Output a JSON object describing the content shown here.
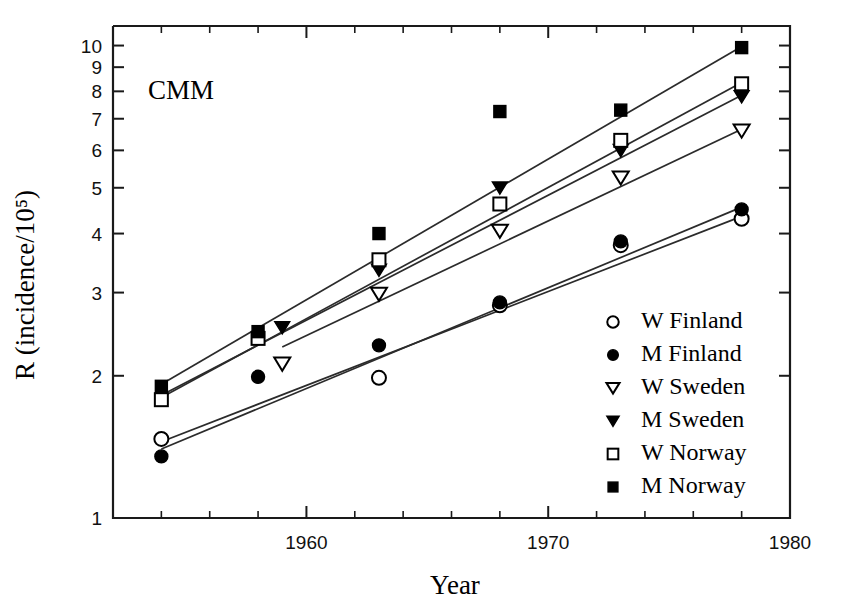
{
  "chart_data": {
    "type": "scatter",
    "title": "",
    "panel_label": "CMM",
    "xlabel": "Year",
    "ylabel": "R (incidence/10⁵)",
    "yscale": "log",
    "xscale": "linear",
    "xlim": [
      1952,
      1980
    ],
    "ylim": [
      1,
      11
    ],
    "grid": false,
    "legend_position": "center-right",
    "x_ticks_major": [
      1960,
      1970,
      1980
    ],
    "x_tick_labels": [
      "1960",
      "1970",
      "1980"
    ],
    "x_ticks_minor": [
      1954,
      1956,
      1958,
      1962,
      1964,
      1966,
      1968,
      1972,
      1974,
      1976,
      1978
    ],
    "y_ticks": [
      1,
      2,
      3,
      4,
      5,
      6,
      7,
      8,
      9,
      10
    ],
    "y_tick_labels": [
      "1",
      "2",
      "3",
      "4",
      "5",
      "6",
      "7",
      "8",
      "9",
      "10"
    ],
    "series": [
      {
        "name": "W Finland",
        "marker": "circle-open",
        "x": [
          1954,
          1963,
          1968,
          1973,
          1978
        ],
        "y": [
          1.47,
          1.98,
          2.82,
          3.78,
          4.3
        ],
        "fit_line": {
          "x": [
            1954,
            1978
          ],
          "y": [
            1.45,
            4.35
          ]
        }
      },
      {
        "name": "M Finland",
        "marker": "circle-filled",
        "x": [
          1954,
          1958,
          1963,
          1968,
          1973,
          1978
        ],
        "y": [
          1.35,
          1.99,
          2.32,
          2.86,
          3.85,
          4.5
        ],
        "fit_line": {
          "x": [
            1954,
            1978
          ],
          "y": [
            1.4,
            4.55
          ]
        }
      },
      {
        "name": "W Sweden",
        "marker": "triangle-down-open",
        "x": [
          1959,
          1963,
          1968,
          1973,
          1978
        ],
        "y": [
          2.12,
          2.98,
          4.05,
          5.25,
          6.6
        ],
        "fit_line": {
          "x": [
            1959,
            1978
          ],
          "y": [
            2.3,
            6.65
          ]
        }
      },
      {
        "name": "M Sweden",
        "marker": "triangle-down-filled",
        "x": [
          1959,
          1963,
          1968,
          1973,
          1978
        ],
        "y": [
          2.53,
          3.35,
          5.0,
          6.0,
          7.8
        ],
        "fit_line": {
          "x": [
            1954,
            1978
          ],
          "y": [
            1.82,
            7.85
          ]
        }
      },
      {
        "name": "W Norway",
        "marker": "square-open",
        "x": [
          1954,
          1958,
          1963,
          1968,
          1973,
          1978
        ],
        "y": [
          1.78,
          2.4,
          3.52,
          4.62,
          6.3,
          8.3
        ],
        "fit_line": {
          "x": [
            1954,
            1978
          ],
          "y": [
            1.8,
            8.35
          ]
        }
      },
      {
        "name": "M Norway",
        "marker": "square-filled",
        "x": [
          1954,
          1958,
          1963,
          1968,
          1973,
          1978
        ],
        "y": [
          1.9,
          2.48,
          4.0,
          7.25,
          7.3,
          9.9
        ],
        "fit_line": {
          "x": [
            1954,
            1978
          ],
          "y": [
            1.92,
            9.95
          ]
        }
      }
    ],
    "legend_entries": [
      {
        "label": "W Finland",
        "marker": "circle-open"
      },
      {
        "label": "M Finland",
        "marker": "circle-filled"
      },
      {
        "label": "W Sweden",
        "marker": "triangle-down-open"
      },
      {
        "label": "M Sweden",
        "marker": "triangle-down-filled"
      },
      {
        "label": "W Norway",
        "marker": "square-open"
      },
      {
        "label": "M Norway",
        "marker": "square-filled"
      }
    ]
  },
  "colors": {
    "background": "#ffffff",
    "ink": "#000000",
    "axis": "#1a1a1a",
    "line": "#2b2b2b"
  }
}
